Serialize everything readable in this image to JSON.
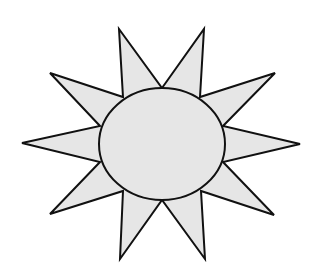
{
  "diagram": {
    "type": "sun-shape",
    "canvas": {
      "width": 317,
      "height": 275,
      "background": "#ffffff"
    },
    "colors": {
      "fill": "#e6e6e6",
      "stroke": "#111111"
    },
    "stroke_width": 2,
    "rays": {
      "count": 10,
      "points": "162,88 204,29 200,97 275,73 223,126 300,144 223,162 274,215 201,191 205,259 162,200 120,259 123,191 50,214 100,162 22,143 100,126 50,73 123,97 119,29"
    },
    "body": {
      "shape": "ellipse",
      "cx": 162,
      "cy": 144,
      "rx": 63,
      "ry": 56
    }
  }
}
